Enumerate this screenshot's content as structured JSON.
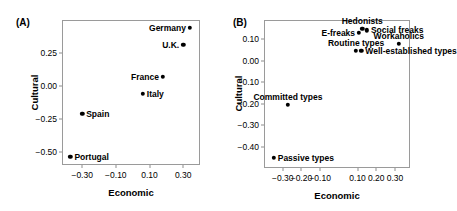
{
  "figure": {
    "panels": [
      {
        "tag": "(A)",
        "xlabel": "Economic",
        "ylabel": "Cultural",
        "xticks": [
          "-0.30",
          "-0.10",
          "0.10",
          "0.30"
        ],
        "yticks": [
          "0.25",
          "0.00",
          "-0.25",
          "-0.50"
        ],
        "points": [
          {
            "label": "Germany",
            "x": 0.34,
            "y": 0.44,
            "side": "l"
          },
          {
            "label": "U.K.",
            "x": 0.3,
            "y": 0.31,
            "side": "l"
          },
          {
            "label": "France",
            "x": 0.18,
            "y": 0.07,
            "side": "l"
          },
          {
            "label": "Italy",
            "x": 0.06,
            "y": -0.06,
            "side": "r"
          },
          {
            "label": "Spain",
            "x": -0.3,
            "y": -0.21,
            "side": "r"
          },
          {
            "label": "Portugal",
            "x": -0.37,
            "y": -0.54,
            "side": "r"
          }
        ]
      },
      {
        "tag": "(B)",
        "xlabel": "Economic",
        "ylabel": "Cultural",
        "xticks": [
          "-0.30",
          "-0.20",
          "-0.10",
          "0.10",
          "0.20",
          "0.30"
        ],
        "yticks": [
          "0.10",
          "0.00",
          "-0.10",
          "-0.20",
          "-0.30",
          "-0.40"
        ],
        "points": [
          {
            "label": "Hedonists",
            "x": 0.125,
            "y": 0.15,
            "side": "c"
          },
          {
            "label": "Social freaks",
            "x": 0.15,
            "y": 0.142,
            "side": "r"
          },
          {
            "label": "E-freaks",
            "x": 0.108,
            "y": 0.13,
            "side": "l"
          },
          {
            "label": "Workaholics",
            "x": 0.32,
            "y": 0.078,
            "side": "c"
          },
          {
            "label": "Well-established types",
            "x": 0.12,
            "y": 0.045,
            "side": "r"
          },
          {
            "label": "Routine types",
            "x": 0.092,
            "y": 0.045,
            "side": "c"
          },
          {
            "label": "Committed types",
            "x": -0.272,
            "y": -0.205,
            "side": "c"
          },
          {
            "label": "Passive types",
            "x": -0.348,
            "y": -0.452,
            "side": "r"
          }
        ]
      }
    ]
  },
  "chart_data": [
    {
      "type": "scatter",
      "title": "(A)",
      "xlabel": "Economic",
      "ylabel": "Cultural",
      "xlim": [
        -0.42,
        0.4
      ],
      "ylim": [
        -0.6,
        0.5
      ],
      "xticks": [
        -0.3,
        -0.1,
        0.1,
        0.3
      ],
      "yticks": [
        0.25,
        0.0,
        -0.25,
        -0.5
      ],
      "grid": false,
      "legend": "none",
      "labels": [
        "Germany",
        "U.K.",
        "France",
        "Italy",
        "Spain",
        "Portugal"
      ],
      "x": [
        0.34,
        0.3,
        0.18,
        0.06,
        -0.3,
        -0.37
      ],
      "y": [
        0.44,
        0.31,
        0.07,
        -0.06,
        -0.21,
        -0.54
      ]
    },
    {
      "type": "scatter",
      "title": "(B)",
      "xlabel": "Economic",
      "ylabel": "Cultural",
      "xlim": [
        -0.4,
        0.38
      ],
      "ylim": [
        -0.5,
        0.19
      ],
      "xticks": [
        -0.3,
        -0.2,
        -0.1,
        0.1,
        0.2,
        0.3
      ],
      "yticks": [
        0.1,
        0.0,
        -0.1,
        -0.2,
        -0.3,
        -0.4
      ],
      "grid": false,
      "legend": "none",
      "labels": [
        "Hedonists",
        "Social freaks",
        "E-freaks",
        "Workaholics",
        "Well-established types",
        "Routine types",
        "Committed types",
        "Passive types"
      ],
      "x": [
        0.125,
        0.15,
        0.108,
        0.32,
        0.12,
        0.092,
        -0.272,
        -0.348
      ],
      "y": [
        0.15,
        0.142,
        0.13,
        0.078,
        0.045,
        0.045,
        -0.205,
        -0.452
      ]
    }
  ]
}
